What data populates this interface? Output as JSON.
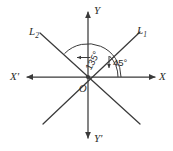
{
  "figure": {
    "type": "coordinate-axes-diagram",
    "background_color": "#ffffff",
    "ink_color": "#3a3a3a",
    "origin": {
      "x": 88,
      "y": 77,
      "label": "O"
    },
    "axes": {
      "x_positive_label": "X",
      "x_negative_label": "X'",
      "y_positive_label": "Y",
      "y_negative_label": "Y'"
    },
    "lines": [
      {
        "name": "L1",
        "label": "L",
        "subscript": "1",
        "angle_deg": 45
      },
      {
        "name": "L2",
        "label": "L",
        "subscript": "2",
        "angle_deg": 135
      }
    ],
    "angles": [
      {
        "name": "angle-45",
        "text": "45°",
        "value": 45,
        "measured_from": "X",
        "measured_to": "L1"
      },
      {
        "name": "angle-135",
        "text": "135°",
        "value": 135,
        "measured_from": "X",
        "measured_to": "L2"
      }
    ]
  }
}
